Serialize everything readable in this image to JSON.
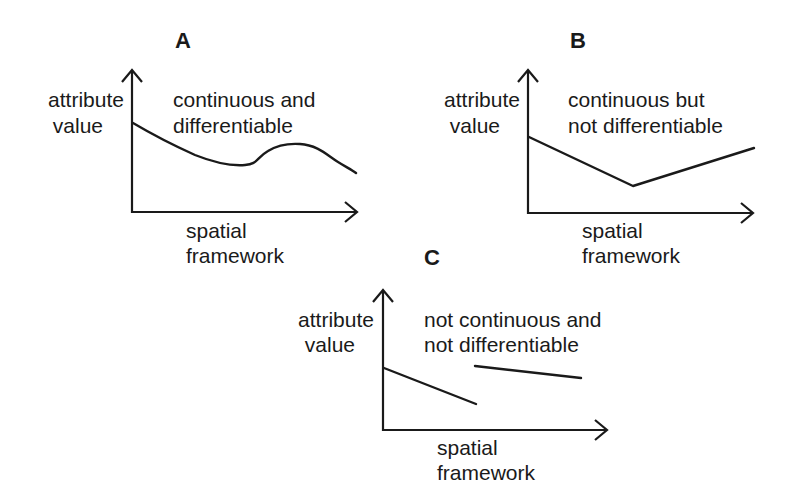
{
  "figure": {
    "panels": [
      {
        "id": "A",
        "label": "A",
        "y_label_line1": "attribute",
        "y_label_line2": "value",
        "x_label_line1": "spatial",
        "x_label_line2": "framework",
        "caption_line1": "continuous and",
        "caption_line2": "differentiable"
      },
      {
        "id": "B",
        "label": "B",
        "y_label_line1": "attribute",
        "y_label_line2": "value",
        "x_label_line1": "spatial",
        "x_label_line2": "framework",
        "caption_line1": "continuous but",
        "caption_line2": "not differentiable"
      },
      {
        "id": "C",
        "label": "C",
        "y_label_line1": "attribute",
        "y_label_line2": "value",
        "x_label_line1": "spatial",
        "x_label_line2": "framework",
        "caption_line1": "not continuous and",
        "caption_line2": "not differentiable"
      }
    ],
    "colors": {
      "ink": "#1a1a1a",
      "background": "#ffffff"
    }
  }
}
